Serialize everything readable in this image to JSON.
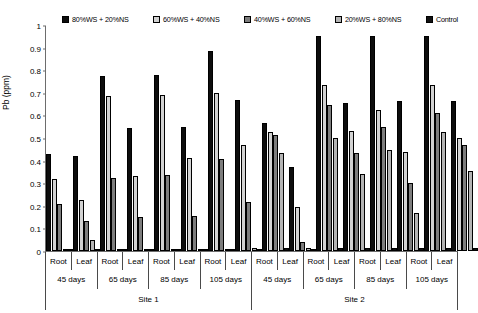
{
  "chart_data": {
    "type": "bar",
    "title": "",
    "xlabel": "",
    "ylabel": "Pb (ppm)",
    "ylim": [
      0,
      1
    ],
    "ytick_labels": [
      "1",
      "0.9",
      "0.8",
      "0.7",
      "0.6",
      "0.5",
      "0.4",
      "0.3",
      "0.2",
      "0.1",
      "0"
    ],
    "ytick_values": [
      1,
      0.9,
      0.8,
      0.7,
      0.6,
      0.5,
      0.4,
      0.3,
      0.2,
      0.1,
      0
    ],
    "grid": false,
    "legend_position": "top",
    "series": [
      {
        "name": "80%WS + 20%NS",
        "color": "#0d0d0d",
        "values": [
          0.43,
          0.42,
          0.775,
          0.545,
          0.78,
          0.55,
          0.885,
          0.67,
          0.565,
          0.37,
          0.95,
          0.655,
          0.95,
          0.665,
          0.95,
          0.665
        ]
      },
      {
        "name": "60%WS + 40%NS",
        "color": "#d2d2d2",
        "values": [
          0.32,
          0.225,
          0.685,
          0.33,
          0.69,
          0.41,
          0.7,
          0.47,
          0.525,
          0.195,
          0.735,
          0.53,
          0.625,
          0.44,
          0.735,
          0.5
        ]
      },
      {
        "name": "40%WS + 60%NS",
        "color": "#7d7d7d",
        "values": [
          0.21,
          0.135,
          0.325,
          0.15,
          0.335,
          0.155,
          0.405,
          0.215,
          0.515,
          0.04,
          0.645,
          0.435,
          0.55,
          0.3,
          0.61,
          0.47
        ]
      },
      {
        "name": "20%WS + 80%NS",
        "color": "#b4b4b4",
        "values": [
          0.01,
          0.05,
          0.01,
          0.005,
          0.01,
          0.01,
          0.01,
          0.015,
          0.435,
          0.015,
          0.5,
          0.34,
          0.445,
          0.17,
          0.525,
          0.355
        ]
      },
      {
        "name": "Control",
        "color": "#111111",
        "values": [
          0.005,
          0.005,
          0.01,
          0.005,
          0.005,
          0.005,
          0.01,
          0.01,
          0.015,
          0.01,
          0.015,
          0.015,
          0.015,
          0.015,
          0.015,
          0.015
        ]
      }
    ],
    "categories": [
      {
        "site": "Site 1",
        "days": "45 days",
        "organ": "Root"
      },
      {
        "site": "Site 1",
        "days": "45 days",
        "organ": "Leaf"
      },
      {
        "site": "Site 1",
        "days": "65 days",
        "organ": "Root"
      },
      {
        "site": "Site 1",
        "days": "65 days",
        "organ": "Leaf"
      },
      {
        "site": "Site 1",
        "days": "85 days",
        "organ": "Root"
      },
      {
        "site": "Site 1",
        "days": "85 days",
        "organ": "Leaf"
      },
      {
        "site": "Site 1",
        "days": "105 days",
        "organ": "Root"
      },
      {
        "site": "Site 1",
        "days": "105 days",
        "organ": "Leaf"
      },
      {
        "site": "Site 2",
        "days": "45 days",
        "organ": "Root"
      },
      {
        "site": "Site 2",
        "days": "45 days",
        "organ": "Leaf"
      },
      {
        "site": "Site 2",
        "days": "65 days",
        "organ": "Root"
      },
      {
        "site": "Site 2",
        "days": "65 days",
        "organ": "Leaf"
      },
      {
        "site": "Site 2",
        "days": "85 days",
        "organ": "Root"
      },
      {
        "site": "Site 2",
        "days": "85 days",
        "organ": "Leaf"
      },
      {
        "site": "Site 2",
        "days": "105 days",
        "organ": "Root"
      },
      {
        "site": "Site 2",
        "days": "105 days",
        "organ": "Leaf"
      }
    ],
    "organ_labels": [
      "Root",
      "Leaf",
      "Root",
      "Leaf",
      "Root",
      "Leaf",
      "Root",
      "Leaf",
      "Root",
      "Leaf",
      "Root",
      "Leaf",
      "Root",
      "Leaf",
      "Root",
      "Leaf"
    ],
    "days_labels": [
      "45 days",
      "65 days",
      "85 days",
      "105 days",
      "45 days",
      "65 days",
      "85 days",
      "105 days"
    ],
    "site_labels": [
      "Site 1",
      "Site 2"
    ]
  }
}
